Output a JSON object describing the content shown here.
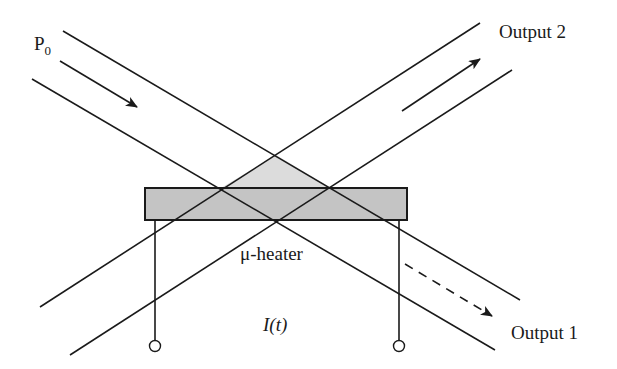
{
  "labels": {
    "input_power": "P",
    "input_power_sub": "0",
    "output_1": "Output 1",
    "output_2": "Output 2",
    "heater": "μ-heater",
    "current": "I(t)"
  },
  "colors": {
    "line": "#1a1a1a",
    "heater_fill": "#c4c4c4",
    "overlap_fill": "#dcdcdc",
    "background": "#ffffff"
  },
  "components": {
    "waveguides": [
      "input-waveguide-top",
      "input-waveguide-bottom",
      "output-waveguide-top",
      "output-waveguide-bottom"
    ],
    "arrows": [
      "input-arrow",
      "output-2-arrow",
      "output-1-dashed-arrow"
    ],
    "heater": "micro-heater",
    "terminals": [
      "left-terminal",
      "right-terminal"
    ]
  }
}
